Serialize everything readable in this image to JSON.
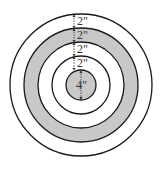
{
  "diagram": {
    "type": "concentric-target",
    "center": {
      "x": 81,
      "y": 85
    },
    "colors": {
      "stroke": "#1a1a1a",
      "gray": "#c8c8c8",
      "white": "#ffffff",
      "label": "#333333"
    },
    "rings": [
      {
        "name": "outer-ring",
        "radius": 71,
        "fill": "#ffffff"
      },
      {
        "name": "gray-ring",
        "radius": 57,
        "fill": "#c8c8c8"
      },
      {
        "name": "middle-ring",
        "radius": 43,
        "fill": "#ffffff"
      },
      {
        "name": "inner-ring",
        "radius": 29,
        "fill": "#ffffff"
      },
      {
        "name": "bullseye",
        "radius": 15,
        "fill": "#c8c8c8"
      }
    ],
    "labels": [
      {
        "name": "outer-ring-width",
        "text": "2\"",
        "y": 21
      },
      {
        "name": "gray-ring-width",
        "text": "2\"",
        "y": 35
      },
      {
        "name": "middle-ring-width",
        "text": "2\"",
        "y": 49
      },
      {
        "name": "inner-ring-width",
        "text": "2\"",
        "y": 63
      },
      {
        "name": "bullseye-diameter",
        "text": "4\"",
        "y": 85
      }
    ]
  }
}
